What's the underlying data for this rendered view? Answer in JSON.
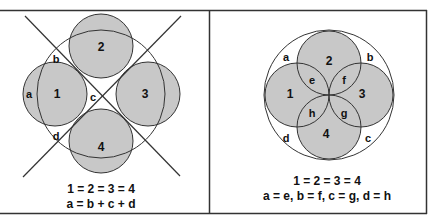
{
  "colors": {
    "frame": "#333333",
    "circle_fill": "#c8c8c8",
    "stroke": "#333333",
    "background": "#ffffff"
  },
  "left_panel": {
    "region_labels": {
      "n1": "1",
      "n2": "2",
      "n3": "3",
      "n4": "4",
      "a": "a",
      "b": "b",
      "c": "c",
      "d": "d"
    },
    "equation_1": "1 = 2 = 3 = 4",
    "equation_2": "a = b + c + d"
  },
  "right_panel": {
    "region_labels": {
      "n1": "1",
      "n2": "2",
      "n3": "3",
      "n4": "4",
      "a": "a",
      "b": "b",
      "c": "c",
      "d": "d",
      "e": "e",
      "f": "f",
      "g": "g",
      "h": "h"
    },
    "equation_1": "1 = 2 = 3 = 4",
    "equation_2": "a = e, b = f, c = g, d = h"
  }
}
